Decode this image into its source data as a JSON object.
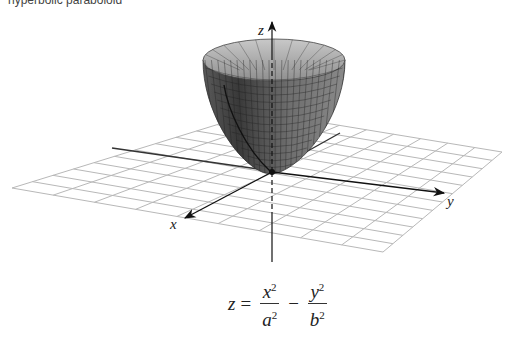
{
  "figure": {
    "top_caption_cutoff": "hyperbolic paraboloid",
    "type": "3d-surface-plot",
    "surface": "elliptic paraboloid (bowl) opening upward with grid mesh",
    "axes": {
      "x": {
        "label": "x"
      },
      "y": {
        "label": "y"
      },
      "z": {
        "label": "z"
      }
    },
    "plane": "xy grid plane",
    "colors": {
      "surface_dark": "#3c3c3c",
      "surface_light": "#a8a8a8",
      "grid": "#b5b5b5",
      "axis": "#222222"
    }
  },
  "equation": {
    "lhs": "z",
    "equals": "=",
    "term1": {
      "num": "x",
      "num_exp": "2",
      "den": "a",
      "den_exp": "2"
    },
    "operator": "−",
    "term2": {
      "num": "y",
      "num_exp": "2",
      "den": "b",
      "den_exp": "2"
    }
  }
}
